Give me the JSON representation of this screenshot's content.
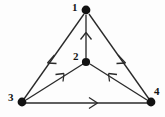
{
  "diagram": {
    "kind": "directed-graph",
    "title": "",
    "background_color": "#fdfdfd",
    "stroke_color": "#2a2a2a",
    "node_fill_color": "#121212",
    "label_color": "#141414",
    "vertices": [
      {
        "id": "1",
        "label": "1",
        "x": 86,
        "y": 10,
        "r": 4.2,
        "label_x": 72,
        "label_y": 2
      },
      {
        "id": "2",
        "label": "2",
        "x": 86,
        "y": 62,
        "r": 4.0,
        "label_x": 73,
        "label_y": 52
      },
      {
        "id": "3",
        "label": "3",
        "x": 22,
        "y": 102,
        "r": 4.2,
        "label_x": 8,
        "label_y": 92
      },
      {
        "id": "4",
        "label": "4",
        "x": 151,
        "y": 102,
        "r": 4.2,
        "label_x": 154,
        "label_y": 86
      }
    ],
    "edges": [
      {
        "from": "1",
        "to": "3",
        "arrow_at": 0.5,
        "arrow_dir": "down-left"
      },
      {
        "from": "1",
        "to": "4",
        "arrow_at": 0.5,
        "arrow_dir": "down-right"
      },
      {
        "from": "2",
        "to": "1",
        "arrow_at": 0.62,
        "arrow_dir": "up"
      },
      {
        "from": "3",
        "to": "2",
        "arrow_at": 0.55,
        "arrow_dir": "up-right"
      },
      {
        "from": "4",
        "to": "2",
        "arrow_at": 0.55,
        "arrow_dir": "up-left"
      },
      {
        "from": "3",
        "to": "4",
        "arrow_at": 0.56,
        "arrow_dir": "right"
      }
    ]
  }
}
